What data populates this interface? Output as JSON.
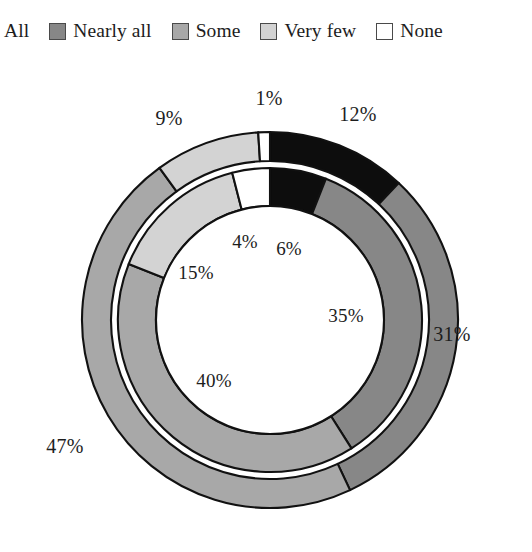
{
  "legend": {
    "items": [
      {
        "label": "All",
        "color": "#0d0d0d",
        "swatch_name": "legend-swatch-all",
        "clipped": true
      },
      {
        "label": "Nearly all",
        "color": "#878787",
        "swatch_name": "legend-swatch-nearly-all",
        "clipped": false
      },
      {
        "label": "Some",
        "color": "#a8a8a8",
        "swatch_name": "legend-swatch-some",
        "clipped": false
      },
      {
        "label": "Very few",
        "color": "#d3d3d3",
        "swatch_name": "legend-swatch-very-few",
        "clipped": false
      },
      {
        "label": "None",
        "color": "#ffffff",
        "swatch_name": "legend-swatch-none",
        "clipped": false
      }
    ]
  },
  "chart_data": {
    "type": "pie",
    "title": "",
    "subtitle": "",
    "xlabel": "",
    "ylabel": "",
    "legend_position": "top",
    "grid": false,
    "donut": true,
    "start_angle_deg": 0,
    "direction": "clockwise",
    "categories": [
      "All",
      "Nearly all",
      "Some",
      "Very few",
      "None"
    ],
    "colors": [
      "#0d0d0d",
      "#878787",
      "#a8a8a8",
      "#d3d3d3",
      "#ffffff"
    ],
    "rings": [
      {
        "name": "outer",
        "values": [
          12,
          31,
          47,
          9,
          1
        ],
        "labels": [
          "12%",
          "31%",
          "47%",
          "9%",
          "1%"
        ]
      },
      {
        "name": "inner",
        "values": [
          6,
          35,
          40,
          15,
          4
        ],
        "labels": [
          "6%",
          "35%",
          "40%",
          "15%",
          "4%"
        ]
      }
    ],
    "series": [
      {
        "name": "outer",
        "values": [
          12,
          31,
          47,
          9,
          1
        ]
      },
      {
        "name": "inner",
        "values": [
          6,
          35,
          40,
          15,
          4
        ]
      }
    ],
    "annotations": {
      "outer": {
        "all": "12%",
        "nearly_all": "31%",
        "some": "47%",
        "very_few": "9%",
        "none": "1%"
      },
      "inner": {
        "all": "6%",
        "nearly_all": "35%",
        "some": "40%",
        "very_few": "15%",
        "none": "4%"
      }
    }
  },
  "geometry": {
    "cx": 270,
    "cy": 272,
    "r_outer": 188,
    "r_mid": 159,
    "r_inner_outer": 152,
    "r_hole": 114
  }
}
